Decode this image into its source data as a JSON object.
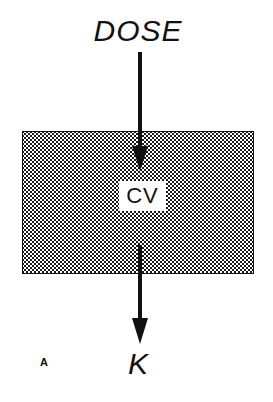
{
  "diagram": {
    "type": "one-compartment pharmacokinetic model",
    "input_label": "DOSE",
    "compartment_label": "CV",
    "output_label": "K",
    "panel_label": "A",
    "arrows": [
      {
        "from": "DOSE",
        "to": "CV",
        "direction": "down"
      },
      {
        "from": "CV",
        "to": "K",
        "direction": "down"
      }
    ],
    "colors": {
      "ink": "#111111",
      "background": "#ffffff",
      "compartment_fill": "stippled dot pattern"
    }
  }
}
